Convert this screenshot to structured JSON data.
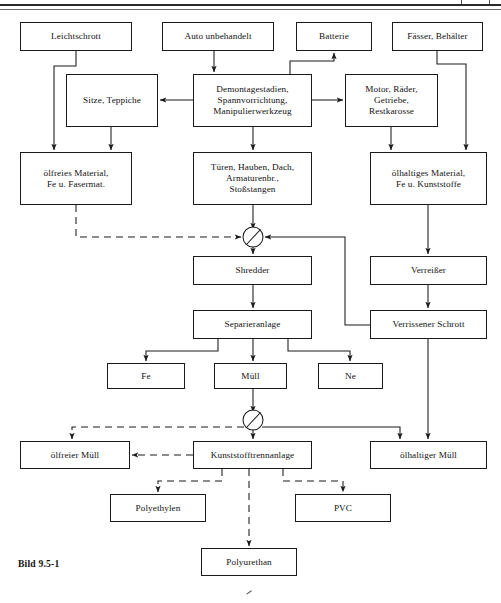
{
  "figure": {
    "caption": "Bild 9.5-1",
    "caption_x": 18,
    "caption_y": 558
  },
  "style": {
    "line_color": "#1a1a1a",
    "box_fill": "#ffffff",
    "text_color": "#121212"
  },
  "nodes": [
    {
      "id": "leichtschrott",
      "label": "Leichtschrott",
      "x": 20,
      "y": 22,
      "w": 112,
      "h": 29
    },
    {
      "id": "auto_unbehandelt",
      "label": "Auto unbehandelt",
      "x": 162,
      "y": 22,
      "w": 112,
      "h": 29
    },
    {
      "id": "batterie",
      "label": "Batterie",
      "x": 296,
      "y": 22,
      "w": 76,
      "h": 29
    },
    {
      "id": "faesser_behaelter",
      "label": "Fässer, Behälter",
      "x": 392,
      "y": 22,
      "w": 91,
      "h": 29
    },
    {
      "id": "sitze_teppiche",
      "label": "Sitze, Teppiche",
      "x": 66,
      "y": 74,
      "w": 92,
      "h": 53
    },
    {
      "id": "demontagestadien",
      "label": "Demontagestadien,\nSpannvorrichtung,\nManipulierwerkzeug",
      "x": 193,
      "y": 74,
      "w": 119,
      "h": 53
    },
    {
      "id": "motor_raeder",
      "label": "Motor, Räder,\nGetriebe,\nRestkarosse",
      "x": 345,
      "y": 74,
      "w": 93,
      "h": 53
    },
    {
      "id": "oelfreies_material",
      "label": "ölfreies Material,\nFe u. Fasermat.",
      "x": 20,
      "y": 152,
      "w": 112,
      "h": 53
    },
    {
      "id": "tueren_hauben",
      "label": "Türen, Hauben, Dach,\nArmaturenbr.,\nStoßstangen",
      "x": 193,
      "y": 152,
      "w": 119,
      "h": 53
    },
    {
      "id": "oelhaltiges_material",
      "label": "ölhaltiges Material,\nFe u. Kunststoffe",
      "x": 370,
      "y": 152,
      "w": 117,
      "h": 53
    },
    {
      "id": "shredder",
      "label": "Shredder",
      "x": 193,
      "y": 256,
      "w": 119,
      "h": 29
    },
    {
      "id": "verreisser",
      "label": "Verreißer",
      "x": 370,
      "y": 256,
      "w": 117,
      "h": 29
    },
    {
      "id": "separieranlage",
      "label": "Separieranlage",
      "x": 193,
      "y": 310,
      "w": 119,
      "h": 29
    },
    {
      "id": "verrissener_schrott",
      "label": "Verrissener Schrott",
      "x": 370,
      "y": 310,
      "w": 117,
      "h": 29
    },
    {
      "id": "fe",
      "label": "Fe",
      "x": 107,
      "y": 363,
      "w": 78,
      "h": 26
    },
    {
      "id": "muell",
      "label": "Müll",
      "x": 214,
      "y": 363,
      "w": 73,
      "h": 26
    },
    {
      "id": "ne",
      "label": "Ne",
      "x": 318,
      "y": 363,
      "w": 65,
      "h": 26
    },
    {
      "id": "oelfreier_muell",
      "label": "ölfreier Müll",
      "x": 20,
      "y": 441,
      "w": 110,
      "h": 28
    },
    {
      "id": "kunststofftrennanlage",
      "label": "Kunststofftrennanlage",
      "x": 193,
      "y": 441,
      "w": 119,
      "h": 28
    },
    {
      "id": "oelhaltiger_muell",
      "label": "ölhaltiger Müll",
      "x": 370,
      "y": 441,
      "w": 117,
      "h": 28
    },
    {
      "id": "polyethylen",
      "label": "Polyethylen",
      "x": 110,
      "y": 494,
      "w": 96,
      "h": 28
    },
    {
      "id": "pvc",
      "label": "PVC",
      "x": 295,
      "y": 494,
      "w": 96,
      "h": 28
    },
    {
      "id": "polyurethan",
      "label": "Polyurethan",
      "x": 201,
      "y": 548,
      "w": 96,
      "h": 28
    }
  ],
  "junctions": [
    {
      "id": "junction-shredder-inlet",
      "cx": 253,
      "cy": 237,
      "r": 10
    },
    {
      "id": "junction-kunststoff-inlet",
      "cx": 253,
      "cy": 420,
      "r": 10
    }
  ],
  "edges": [
    {
      "id": "leichtschrott-to-oelfreies",
      "from": "leichtschrott",
      "to": "oelfreies-material",
      "style": "solid",
      "points": "76,51 76,66 54,66 54,152",
      "arrow": "54,152"
    },
    {
      "id": "leichtschrott-to-sitze",
      "from": "leichtschrott",
      "to": "sitze-teppiche",
      "style": "solid",
      "points": "",
      "arrow": ""
    },
    {
      "id": "auto-to-demontage",
      "from": "auto-unbehandelt",
      "to": "demontagestadien",
      "style": "solid",
      "points": "214,51 214,74",
      "arrow": "214,74"
    },
    {
      "id": "demontage-to-sitze",
      "from": "demontagestadien",
      "to": "sitze-teppiche",
      "style": "solid",
      "points": "193,100 158,100",
      "arrow": "158,100"
    },
    {
      "id": "demontage-to-motor",
      "from": "demontagestadien",
      "to": "motor-raeder",
      "style": "solid",
      "points": "312,100 345,100",
      "arrow": "345,100"
    },
    {
      "id": "demontage-to-batterie",
      "from": "demontagestadien",
      "to": "batterie",
      "style": "solid",
      "points": "290,74 290,61 334,61 334,51",
      "arrow": "334,51"
    },
    {
      "id": "demontage-to-tueren",
      "from": "demontagestadien",
      "to": "tueren-hauben",
      "style": "solid",
      "points": "253,127 253,152",
      "arrow": "253,152"
    },
    {
      "id": "sitze-to-oelfreies",
      "from": "sitze-teppiche",
      "to": "oelfreies-material",
      "style": "solid",
      "points": "111,127 111,152",
      "arrow": "111,152"
    },
    {
      "id": "faesser-to-oelhaltiges",
      "from": "faesser-behaelter",
      "to": "oelhaltiges-material",
      "style": "solid",
      "points": "437,51 437,64 466,64 466,152",
      "arrow": "466,152"
    },
    {
      "id": "motor-to-oelhaltiges",
      "from": "motor-raeder",
      "to": "oelhaltiges-material",
      "style": "solid",
      "points": "391,127 391,152",
      "arrow": "391,152"
    },
    {
      "id": "tueren-to-junction",
      "from": "tueren-hauben",
      "to": "junction-shredder",
      "style": "solid",
      "points": "253,205 253,227",
      "arrow": "253,227"
    },
    {
      "id": "oelfreies-to-junction-dashed",
      "from": "oelfreies-material",
      "to": "junction-shredder",
      "style": "dashed",
      "points": "76,205 76,237 243,237",
      "arrow": "243,237"
    },
    {
      "id": "verrissener-to-junction",
      "from": "verrissener-schrott",
      "to": "junction-shredder",
      "style": "solid",
      "points": "370,325 345,325 345,237 263,237",
      "arrow": "263,237"
    },
    {
      "id": "junction-to-shredder",
      "from": "junction-shredder",
      "to": "shredder",
      "style": "solid",
      "points": "253,247 253,256",
      "arrow": "253,256"
    },
    {
      "id": "oelhaltiges-to-verreisser",
      "from": "oelhaltiges-material",
      "to": "verreisser",
      "style": "solid",
      "points": "428,205 428,256",
      "arrow": "428,256"
    },
    {
      "id": "shredder-to-separieranlage",
      "from": "shredder",
      "to": "separieranlage",
      "style": "solid",
      "points": "253,285 253,310",
      "arrow": "253,310"
    },
    {
      "id": "verreisser-to-verrissener",
      "from": "verreisser",
      "to": "verrissener-schrott",
      "style": "solid",
      "points": "428,285 428,310",
      "arrow": "428,310"
    },
    {
      "id": "separieranlage-to-fe",
      "from": "separieranlage",
      "to": "fe",
      "style": "solid",
      "points": "218,339 218,351 146,351 146,363",
      "arrow": "146,363"
    },
    {
      "id": "separieranlage-to-muell",
      "from": "separieranlage",
      "to": "muell",
      "style": "solid",
      "points": "253,339 253,363",
      "arrow": "253,363"
    },
    {
      "id": "separieranlage-to-ne",
      "from": "separieranlage",
      "to": "ne",
      "style": "solid",
      "points": "288,339 288,351 350,351 350,363",
      "arrow": "350,363"
    },
    {
      "id": "muell-to-junction2",
      "from": "muell",
      "to": "junction-kunststoff",
      "style": "solid",
      "points": "253,389 253,410",
      "arrow": "253,410"
    },
    {
      "id": "verrissener-to-oelhaltiger",
      "from": "verrissener-schrott",
      "to": "oelhaltiger-muell",
      "style": "solid",
      "points": "428,339 428,441",
      "arrow": "428,441"
    },
    {
      "id": "junction2-to-oelhaltiger",
      "from": "junction-kunststoff",
      "to": "oelhaltiger-muell",
      "style": "solid",
      "points": "263,427 400,427 400,441",
      "arrow": "400,441"
    },
    {
      "id": "junction2-to-oelfreier-dashed",
      "from": "junction-kunststoff",
      "to": "oelfreier-muell",
      "style": "dashed",
      "points": "243,427 72,427 72,441",
      "arrow": "72,441"
    },
    {
      "id": "junction2-to-kunststofftrenn",
      "from": "junction-kunststoff",
      "to": "kunststofftrennanlage",
      "style": "solid",
      "points": "253,430 253,441",
      "arrow": "253,441"
    },
    {
      "id": "kunststoff-to-oelfreier-dashed",
      "from": "kunststofftrennanlage",
      "to": "oelfreier-muell",
      "style": "dashed",
      "points": "193,455 130,455",
      "arrow": "130,455"
    },
    {
      "id": "kunststoff-to-polyethylen",
      "from": "kunststofftrennanlage",
      "to": "polyethylen",
      "style": "dashed",
      "points": "222,469 222,481 158,481 158,494",
      "arrow": "158,494"
    },
    {
      "id": "kunststoff-to-pvc",
      "from": "kunststofftrennanlage",
      "to": "pvc",
      "style": "dashed",
      "points": "283,469 283,481 343,481 343,494",
      "arrow": "343,494"
    },
    {
      "id": "kunststoff-to-polyurethan",
      "from": "kunststofftrennanlage",
      "to": "polyurethan",
      "style": "dashed",
      "points": "249,469 249,548",
      "arrow": "249,548"
    }
  ]
}
